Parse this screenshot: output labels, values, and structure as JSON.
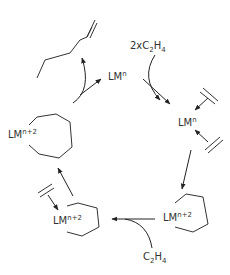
{
  "diagram": {
    "labels": {
      "lm_top": {
        "base": "LM",
        "sup": "n"
      },
      "lm_right": {
        "base": "LM",
        "sup": "n"
      },
      "metallacycloheptane": {
        "base": "LM",
        "sup": "n+2"
      },
      "metallacyclopentane_right": {
        "base": "LM",
        "sup": "n+2"
      },
      "metallacyclopentane_left": {
        "base": "LM",
        "sup": "n+2"
      },
      "reagent_top": {
        "prefix": "2xC",
        "sub1": "2",
        "mid": "H",
        "sub2": "4"
      },
      "reagent_bottom": {
        "prefix": "C",
        "sub1": "2",
        "mid": "H",
        "sub2": "4"
      }
    },
    "species": [
      "1-hexene",
      "LM^n",
      "LM^n bis(ethylene)",
      "metallacyclopentane LM^n+2",
      "metallacyclopentane + ethylene",
      "metallacycloheptane LM^n+2"
    ],
    "colors": {
      "stroke": "#333333",
      "background": "#ffffff"
    }
  }
}
